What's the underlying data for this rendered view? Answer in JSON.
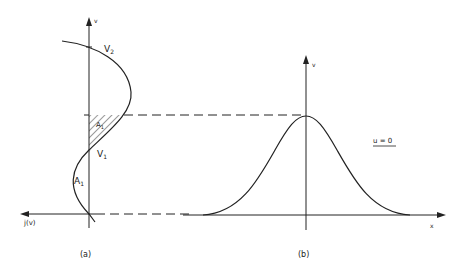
{
  "figure": {
    "panel_a": {
      "caption": "(a)",
      "v_axis_label": "v",
      "h_axis_label": "j(v)",
      "point_upper": "V",
      "point_upper_sub": "2",
      "point_lower": "V",
      "point_lower_sub": "1",
      "area_shaded": "A",
      "area_shaded_sub": "1",
      "area_lower": "A",
      "area_lower_sub": "1"
    },
    "panel_b": {
      "caption": "(b)",
      "v_axis_label": "v",
      "x_axis_label": "x",
      "condition": "u = 0"
    },
    "colors": {
      "ink": "#222222",
      "background": "#ffffff"
    }
  }
}
